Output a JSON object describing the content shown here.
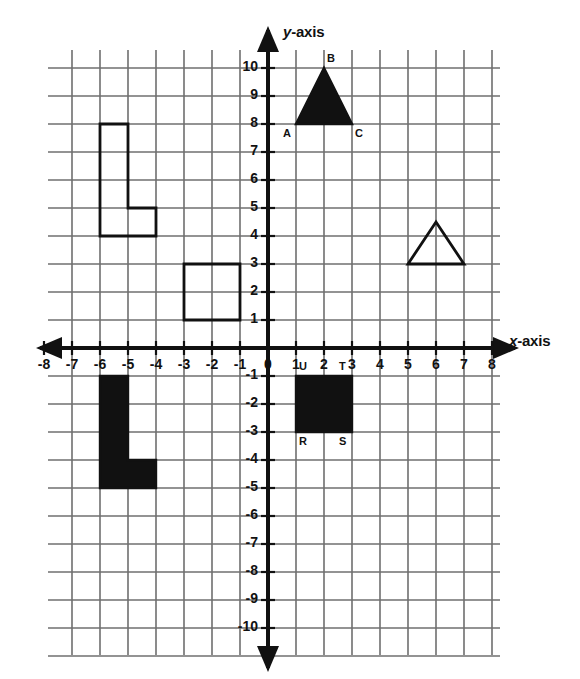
{
  "figure": {
    "background_color": "#ffffff",
    "grid_color": "#6f6f6f",
    "axis_color": "#111111",
    "shape_fill_color": "#111111"
  },
  "axes": {
    "x_label_var": "x",
    "x_label_rest": "-axis",
    "y_label_var": "y",
    "y_label_rest": "-axis",
    "x_ticks": [
      "-8",
      "-7",
      "-6",
      "-5",
      "-4",
      "-3",
      "-2",
      "-1",
      "0",
      "1",
      "2",
      "3",
      "4",
      "5",
      "6",
      "7",
      "8"
    ],
    "x_tick_values": [
      -8,
      -7,
      -6,
      -5,
      -4,
      -3,
      -2,
      -1,
      0,
      1,
      2,
      3,
      4,
      5,
      6,
      7,
      8
    ],
    "y_ticks_positive": [
      "10",
      "9",
      "8",
      "7",
      "6",
      "5",
      "4",
      "3",
      "2",
      "1"
    ],
    "y_tick_values_positive": [
      10,
      9,
      8,
      7,
      6,
      5,
      4,
      3,
      2,
      1
    ],
    "y_ticks_negative": [
      "-1",
      "-2",
      "-3",
      "-4",
      "-5",
      "-6",
      "-7",
      "-8",
      "-9",
      "-10"
    ],
    "y_tick_values_negative": [
      -1,
      -2,
      -3,
      -4,
      -5,
      -6,
      -7,
      -8,
      -9,
      -10
    ],
    "origin_label": "0",
    "x_range": [
      -8,
      8
    ],
    "y_range": [
      -10,
      10
    ]
  },
  "chart_data": {
    "type": "scatter",
    "xlabel": "x-axis",
    "ylabel": "y-axis",
    "xlim": [
      -8,
      8
    ],
    "ylim": [
      -10,
      10
    ],
    "grid": true,
    "legend": "none",
    "shapes": [
      {
        "name": "triangle-abc",
        "kind": "triangle",
        "style": "filled",
        "points": [
          [
            1,
            8
          ],
          [
            2,
            10
          ],
          [
            3,
            8
          ]
        ],
        "vertex_labels": [
          {
            "text": "A",
            "x": 1,
            "y": 8,
            "anchor": "below-left"
          },
          {
            "text": "B",
            "x": 2,
            "y": 10,
            "anchor": "above-right"
          },
          {
            "text": "C",
            "x": 3,
            "y": 8,
            "anchor": "below-right"
          }
        ]
      },
      {
        "name": "l-shape-outlined",
        "kind": "polygon",
        "style": "outlined",
        "points": [
          [
            -6,
            8
          ],
          [
            -5,
            8
          ],
          [
            -5,
            5
          ],
          [
            -4,
            5
          ],
          [
            -4,
            4
          ],
          [
            -6,
            4
          ]
        ],
        "vertex_labels": []
      },
      {
        "name": "square-outlined",
        "kind": "rectangle",
        "style": "outlined",
        "points": [
          [
            -3,
            3
          ],
          [
            -1,
            3
          ],
          [
            -1,
            1
          ],
          [
            -3,
            1
          ]
        ],
        "vertex_labels": []
      },
      {
        "name": "triangle-outlined",
        "kind": "triangle",
        "style": "outlined",
        "points": [
          [
            5,
            3
          ],
          [
            6,
            4.5
          ],
          [
            7,
            3
          ]
        ],
        "vertex_labels": []
      },
      {
        "name": "l-shape-filled",
        "kind": "polygon",
        "style": "filled",
        "points": [
          [
            -6,
            -1
          ],
          [
            -5,
            -1
          ],
          [
            -5,
            -4
          ],
          [
            -4,
            -4
          ],
          [
            -4,
            -5
          ],
          [
            -6,
            -5
          ]
        ],
        "vertex_labels": []
      },
      {
        "name": "rectangle-rstu",
        "kind": "rectangle",
        "style": "filled",
        "points": [
          [
            1,
            -1
          ],
          [
            3,
            -1
          ],
          [
            3,
            -3
          ],
          [
            1,
            -3
          ]
        ],
        "vertex_labels": [
          {
            "text": "U",
            "x": 1,
            "y": -1,
            "anchor": "above-right"
          },
          {
            "text": "T",
            "x": 3,
            "y": -1,
            "anchor": "above-left"
          },
          {
            "text": "R",
            "x": 1,
            "y": -3,
            "anchor": "below-right"
          },
          {
            "text": "S",
            "x": 3,
            "y": -3,
            "anchor": "below-left"
          }
        ]
      }
    ]
  },
  "geometry": {
    "origin_px": [
      268,
      348
    ],
    "unit_px": 28,
    "grid_x_px": [
      48,
      500
    ],
    "grid_y_px": [
      50,
      655
    ]
  }
}
